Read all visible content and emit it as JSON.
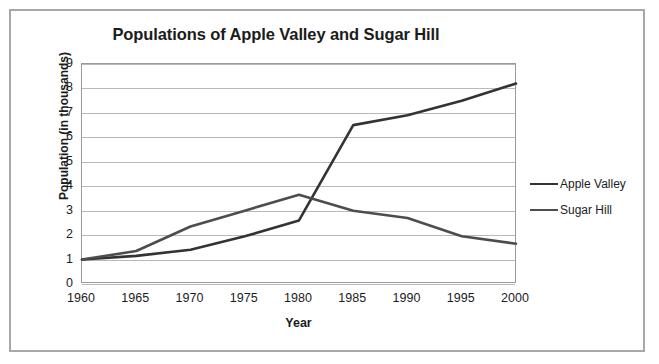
{
  "chart_data": {
    "type": "line",
    "title": "Populations of Apple Valley and Sugar Hill",
    "xlabel": "Year",
    "ylabel": "Population (in thousands)",
    "categories": [
      "1960",
      "1965",
      "1970",
      "1975",
      "1980",
      "1985",
      "1990",
      "1995",
      "2000"
    ],
    "x": [
      1960,
      1965,
      1970,
      1975,
      1980,
      1985,
      1990,
      1995,
      2000
    ],
    "series": [
      {
        "name": "Apple Valley",
        "color": "#333333",
        "values": [
          1.0,
          1.15,
          1.4,
          1.95,
          2.6,
          6.5,
          6.9,
          7.5,
          8.2
        ]
      },
      {
        "name": "Sugar Hill",
        "color": "#4d4d4d",
        "values": [
          1.0,
          1.35,
          2.35,
          3.0,
          3.65,
          3.0,
          2.7,
          1.95,
          1.65
        ]
      }
    ],
    "ylim": [
      0,
      9
    ],
    "yticks": [
      "0",
      "1",
      "2",
      "3",
      "4",
      "5",
      "6",
      "7",
      "8",
      "9"
    ],
    "xlim": [
      1960,
      2000
    ],
    "grid": "horizontal",
    "legend_position": "right",
    "plot_border_color": "#9a9a9a",
    "gridline_color": "#b9b9b9",
    "frame_border_color": "#a8a8a8",
    "background_color": "#ffffff"
  }
}
